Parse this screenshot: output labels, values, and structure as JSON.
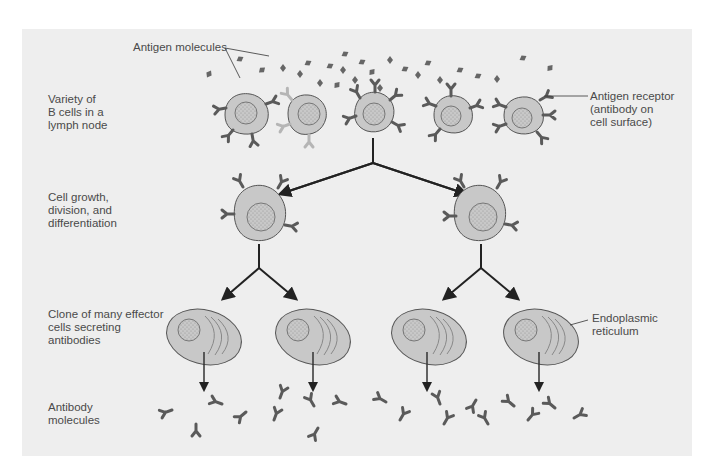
{
  "figure": {
    "background_color": "#eeeeee",
    "cell_fill": "#c8c8c8",
    "antibody_color": "#5a5a5a",
    "arrow_color": "#222222"
  },
  "stage_labels": [
    {
      "id": "stage-1",
      "text": "Variety of\nB cells in a\nlymph node"
    },
    {
      "id": "stage-2",
      "text": "Cell growth,\ndivision, and\ndifferentiation"
    },
    {
      "id": "stage-3",
      "text": "Clone of many effector\ncells secreting\nantibodies"
    },
    {
      "id": "stage-4",
      "text": "Antibody\nmolecules"
    }
  ],
  "callouts": {
    "antigen": "Antigen molecules",
    "receptor": "Antigen receptor\n(antibody on\ncell surface)",
    "er": "Endoplasmic\nreticulum"
  }
}
